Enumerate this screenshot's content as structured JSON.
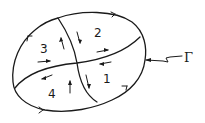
{
  "diagram": {
    "title": "",
    "boundary_label": "Γ",
    "regions": [
      {
        "id": "region-1",
        "label": "1"
      },
      {
        "id": "region-2",
        "label": "2"
      },
      {
        "id": "region-3",
        "label": "3"
      },
      {
        "id": "region-4",
        "label": "4"
      }
    ],
    "boundary_orientation": "counter-clockwise",
    "colors": {
      "ink": "#1a1a1a",
      "background": "#ffffff"
    }
  }
}
